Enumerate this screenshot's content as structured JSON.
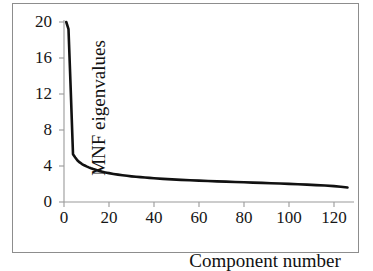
{
  "figure": {
    "background_color": "#ffffff",
    "frame_color": "#8d8d8d",
    "axis_color": "#9a9a9a",
    "text_color": "#161616"
  },
  "chart_data": {
    "type": "line",
    "title": "",
    "subtitle": "",
    "xlabel": "Component number",
    "ylabel": "MNF eigenvalues",
    "xlim": [
      0,
      128
    ],
    "ylim": [
      0,
      20
    ],
    "xticks": [
      0,
      20,
      40,
      60,
      80,
      100,
      120
    ],
    "yticks": [
      0,
      4,
      8,
      12,
      16,
      20
    ],
    "xtick_labels": [
      "0",
      "20",
      "40",
      "60",
      "80",
      "100",
      "120"
    ],
    "ytick_labels": [
      "0",
      "4",
      "8",
      "12",
      "16",
      "20"
    ],
    "grid": false,
    "legend": null,
    "legend_position": "none",
    "annotations": [],
    "series": [
      {
        "name": "MNF eigenvalues",
        "color": "#111111",
        "line_width": 2.6,
        "x": [
          1,
          2,
          3,
          4,
          5,
          6,
          7,
          8,
          9,
          10,
          11,
          12,
          13,
          14,
          15,
          16,
          17,
          18,
          19,
          20,
          22,
          24,
          26,
          28,
          30,
          32,
          34,
          36,
          38,
          40,
          44,
          48,
          52,
          56,
          60,
          64,
          68,
          72,
          76,
          80,
          84,
          88,
          92,
          96,
          100,
          104,
          108,
          112,
          116,
          120,
          123,
          126
        ],
        "values": [
          20.0,
          19.2,
          12.4,
          5.3,
          4.95,
          4.62,
          4.4,
          4.22,
          4.08,
          3.96,
          3.85,
          3.75,
          3.66,
          3.58,
          3.5,
          3.43,
          3.37,
          3.31,
          3.26,
          3.21,
          3.12,
          3.04,
          2.97,
          2.91,
          2.85,
          2.8,
          2.76,
          2.72,
          2.68,
          2.64,
          2.57,
          2.51,
          2.46,
          2.41,
          2.37,
          2.33,
          2.29,
          2.26,
          2.22,
          2.19,
          2.15,
          2.12,
          2.08,
          2.05,
          2.01,
          1.97,
          1.93,
          1.88,
          1.83,
          1.76,
          1.7,
          1.62
        ]
      }
    ]
  }
}
